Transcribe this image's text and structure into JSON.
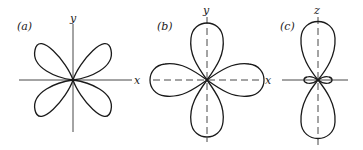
{
  "figure": {
    "panels": [
      {
        "id": "a",
        "label": "(a)",
        "axes": {
          "horizontal": "x",
          "vertical": "y",
          "style": "solid"
        },
        "shape": "four-lobed, lobes along diagonals (d_xy-type)"
      },
      {
        "id": "b",
        "label": "(b)",
        "axes": {
          "horizontal": "x",
          "vertical": "y",
          "style": "dashed"
        },
        "shape": "four-lobed, lobes along axes (d_x2-y2-type)"
      },
      {
        "id": "c",
        "label": "(c)",
        "axes": {
          "horizontal": "",
          "vertical": "z",
          "style": "vertical dashed, horizontal solid"
        },
        "shape": "two large lobes along z with small torus-like lobes in the xy-plane (d_z2-type)"
      }
    ]
  }
}
